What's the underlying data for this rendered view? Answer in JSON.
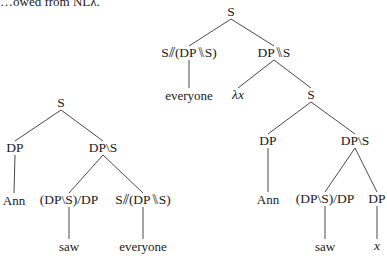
{
  "caption": "…owed from NLλ.",
  "trees": [
    {
      "id": "left-tree",
      "nodes": [
        {
          "id": "l-s",
          "label": "S",
          "x": 61,
          "y": 103
        },
        {
          "id": "l-dp",
          "label": "DP",
          "x": 15,
          "y": 148
        },
        {
          "id": "l-dps",
          "label": "DP\\S",
          "x": 103,
          "y": 148
        },
        {
          "id": "l-ann",
          "label": "Ann",
          "x": 14,
          "y": 200,
          "word": true
        },
        {
          "id": "l-tv",
          "label": "(DP\\S)/DP",
          "x": 69,
          "y": 200
        },
        {
          "id": "l-q",
          "label": "S⫽(DP⑊S)",
          "x": 143,
          "y": 200
        },
        {
          "id": "l-saw",
          "label": "saw",
          "x": 69,
          "y": 246,
          "word": true
        },
        {
          "id": "l-everyone",
          "label": "everyone",
          "x": 143,
          "y": 246,
          "word": true
        }
      ],
      "edges": [
        [
          "l-s",
          "l-dp"
        ],
        [
          "l-s",
          "l-dps"
        ],
        [
          "l-dp",
          "l-ann"
        ],
        [
          "l-dps",
          "l-tv"
        ],
        [
          "l-dps",
          "l-q"
        ],
        [
          "l-tv",
          "l-saw"
        ],
        [
          "l-q",
          "l-everyone"
        ]
      ]
    },
    {
      "id": "right-tree",
      "nodes": [
        {
          "id": "r-s",
          "label": "S",
          "x": 231,
          "y": 12
        },
        {
          "id": "r-q",
          "label": "S⫽(DP⑊S)",
          "x": 189,
          "y": 53
        },
        {
          "id": "r-dpds",
          "label": "DP⑊S",
          "x": 274,
          "y": 53
        },
        {
          "id": "r-everyone",
          "label": "everyone",
          "x": 189,
          "y": 95,
          "word": true
        },
        {
          "id": "r-lambda",
          "label": "λx",
          "x": 238,
          "y": 95,
          "italic": true
        },
        {
          "id": "r-s2",
          "label": "S",
          "x": 311,
          "y": 95
        },
        {
          "id": "r-dp",
          "label": "DP",
          "x": 268,
          "y": 141
        },
        {
          "id": "r-dps",
          "label": "DP\\S",
          "x": 355,
          "y": 141
        },
        {
          "id": "r-ann",
          "label": "Ann",
          "x": 268,
          "y": 199,
          "word": true
        },
        {
          "id": "r-tv",
          "label": "(DP\\S)/DP",
          "x": 325,
          "y": 199
        },
        {
          "id": "r-dp2",
          "label": "DP",
          "x": 377,
          "y": 199
        },
        {
          "id": "r-saw",
          "label": "saw",
          "x": 325,
          "y": 246,
          "word": true
        },
        {
          "id": "r-x",
          "label": "x",
          "x": 377,
          "y": 246,
          "italic": true
        }
      ],
      "edges": [
        [
          "r-s",
          "r-q"
        ],
        [
          "r-s",
          "r-dpds"
        ],
        [
          "r-q",
          "r-everyone"
        ],
        [
          "r-dpds",
          "r-lambda"
        ],
        [
          "r-dpds",
          "r-s2"
        ],
        [
          "r-s2",
          "r-dp"
        ],
        [
          "r-s2",
          "r-dps"
        ],
        [
          "r-dp",
          "r-ann"
        ],
        [
          "r-dps",
          "r-tv"
        ],
        [
          "r-dps",
          "r-dp2"
        ],
        [
          "r-tv",
          "r-saw"
        ],
        [
          "r-dp2",
          "r-x"
        ]
      ]
    }
  ]
}
